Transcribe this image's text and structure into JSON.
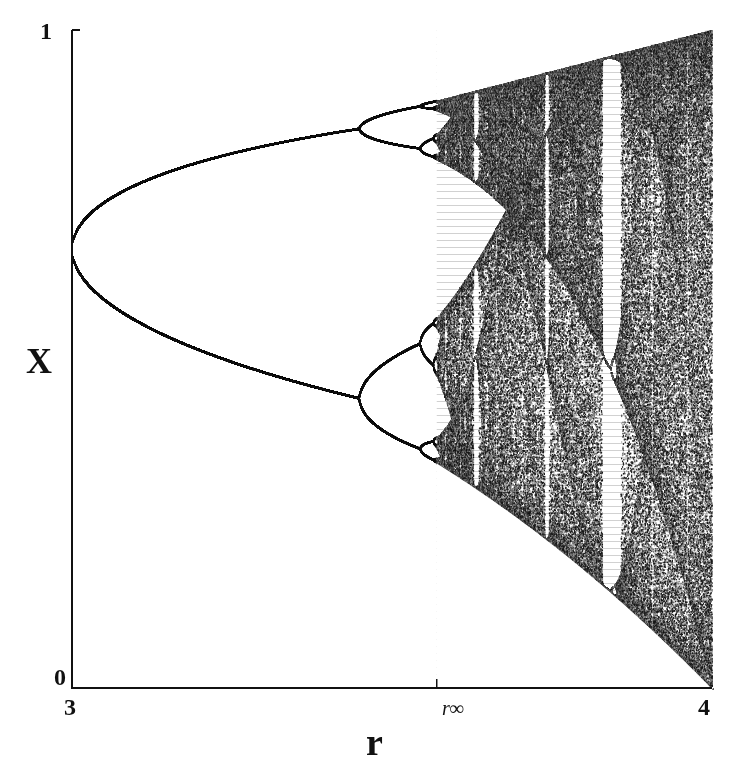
{
  "chart_data": {
    "type": "scatter",
    "title": "",
    "subtitle": "Bifurcation diagram of the logistic map",
    "xlabel": "r",
    "ylabel": "X",
    "xlim": [
      3,
      4
    ],
    "ylim": [
      0,
      1
    ],
    "x_ticks": [
      {
        "value": 3,
        "label": "3"
      },
      {
        "value": 3.5699,
        "label": "r∞"
      },
      {
        "value": 4,
        "label": "4"
      }
    ],
    "y_ticks": [
      {
        "value": 0,
        "label": "0"
      },
      {
        "value": 1,
        "label": "1"
      }
    ],
    "grid": false,
    "legend": null,
    "series": [
      {
        "name": "attractor x-values",
        "map": "x_{n+1} = r x_n (1 - x_n)",
        "r_min": 3.0,
        "r_max": 4.0,
        "x_at_r3": 0.667
      }
    ],
    "annotations": [
      {
        "type": "bifurcation",
        "r": 3.0,
        "from_period": 1,
        "to_period": 2
      },
      {
        "type": "bifurcation",
        "r": 3.449,
        "from_period": 2,
        "to_period": 4
      },
      {
        "type": "bifurcation",
        "r": 3.544,
        "from_period": 4,
        "to_period": 8
      },
      {
        "type": "onset_of_chaos",
        "r": 3.5699,
        "label": "r∞"
      },
      {
        "type": "periodic_window",
        "r": 3.63,
        "period": 6
      },
      {
        "type": "periodic_window",
        "r": 3.74,
        "period": 5
      },
      {
        "type": "periodic_window",
        "r": 3.83,
        "period": 3
      }
    ]
  },
  "axes": {
    "x_label": "r",
    "y_label": "X",
    "y_top": "1",
    "y_bottom": "0",
    "x_left": "3",
    "x_right": "4",
    "x_mark": "r∞"
  },
  "colors": {
    "ink": "#111111",
    "chaos_fill": "#3a3a3a",
    "background": "#ffffff"
  }
}
